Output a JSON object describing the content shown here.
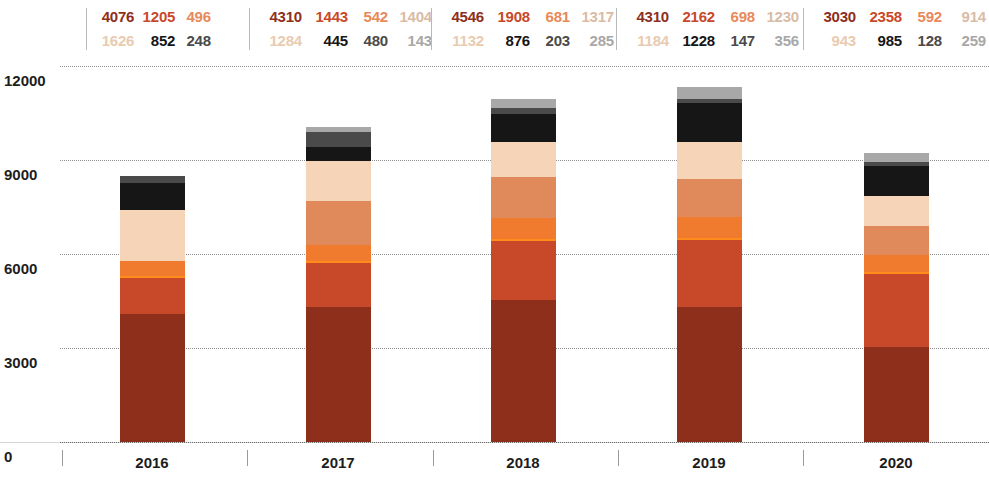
{
  "chart_data": {
    "type": "bar",
    "subtype": "stacked",
    "title": "",
    "xlabel": "",
    "ylabel": "",
    "categories": [
      "2016",
      "2017",
      "2018",
      "2019",
      "2020"
    ],
    "ylim": [
      0,
      12000
    ],
    "yticks": [
      0,
      3000,
      6000,
      9000,
      12000
    ],
    "ytick_labels": [
      "0",
      "3000",
      "6000",
      "9000",
      "12000"
    ],
    "grid": true,
    "legend": "none",
    "series": [
      {
        "name": "s1",
        "color": "#8e2f1c",
        "values": [
          4076,
          4310,
          4546,
          4310,
          3030
        ]
      },
      {
        "name": "s2",
        "color": "#c8492a",
        "values": [
          1205,
          1443,
          1908,
          2162,
          2358
        ]
      },
      {
        "name": "s3",
        "color": "#f07a2e",
        "values": [
          496,
          542,
          681,
          698,
          592
        ]
      },
      {
        "name": "s4",
        "color": "#e08a5c",
        "values": [
          null,
          1404,
          1317,
          1230,
          914
        ]
      },
      {
        "name": "s5",
        "color": "#f6d4b8",
        "values": [
          1626,
          1284,
          1132,
          1184,
          943
        ]
      },
      {
        "name": "s6",
        "color": "#161616",
        "values": [
          852,
          445,
          876,
          1228,
          985
        ]
      },
      {
        "name": "s7",
        "color": "#4a4a4a",
        "values": [
          248,
          480,
          203,
          147,
          128
        ]
      },
      {
        "name": "s8",
        "color": "#a8a8a8",
        "values": [
          null,
          143,
          285,
          356,
          259
        ]
      }
    ],
    "value_labels": {
      "2016": {
        "row1": [
          "4076",
          "1205",
          "496",
          ""
        ],
        "row2": [
          "1626",
          "852",
          "248",
          ""
        ]
      },
      "2017": {
        "row1": [
          "4310",
          "1443",
          "542",
          "1404"
        ],
        "row2": [
          "1284",
          "445",
          "480",
          "143"
        ]
      },
      "2018": {
        "row1": [
          "4546",
          "1908",
          "681",
          "1317"
        ],
        "row2": [
          "1132",
          "876",
          "203",
          "285"
        ]
      },
      "2019": {
        "row1": [
          "4310",
          "2162",
          "698",
          "1230"
        ],
        "row2": [
          "1184",
          "1228",
          "147",
          "356"
        ]
      },
      "2020": {
        "row1": [
          "3030",
          "2358",
          "592",
          "914"
        ],
        "row2": [
          "943",
          "985",
          "128",
          "259"
        ]
      }
    },
    "label_colors": {
      "row1": [
        "#8e2f1c",
        "#c8492a",
        "#e8895a",
        "#d9bba6"
      ],
      "row2": [
        "#e8cbb0",
        "#161616",
        "#4a4a4a",
        "#a8a8a8"
      ]
    }
  },
  "axis": {
    "y_labels": [
      "12000",
      "9000",
      "6000",
      "3000",
      "0"
    ],
    "x_labels": [
      "2016",
      "2017",
      "2018",
      "2019",
      "2020"
    ]
  }
}
